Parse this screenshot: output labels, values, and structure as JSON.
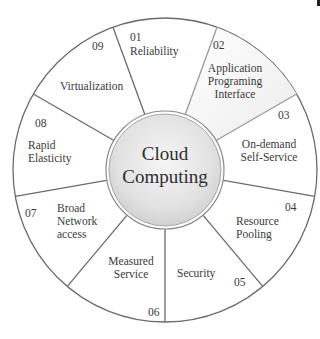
{
  "diagram": {
    "title": "Cloud Computing",
    "center": {
      "line1": "Cloud",
      "line2": "Computing"
    },
    "colors": {
      "outline": "#6b6b6b",
      "segment_fill": "#ffffff",
      "highlight_fill": "#f1f1f1",
      "center_fill_light": "#f7f7f7",
      "center_fill_dark": "#d6d6d6",
      "text": "#3a3a3a"
    },
    "segments": [
      {
        "number": "01",
        "lines": [
          "Reliability"
        ]
      },
      {
        "number": "02",
        "lines": [
          "Application",
          "Programing",
          "Interface"
        ],
        "highlighted": true
      },
      {
        "number": "03",
        "lines": [
          "On-demand",
          "Self-Service"
        ]
      },
      {
        "number": "04",
        "lines": [
          "Resource",
          "Pooling"
        ]
      },
      {
        "number": "05",
        "lines": [
          "Security"
        ]
      },
      {
        "number": "06",
        "lines": [
          "Measured",
          "Service"
        ]
      },
      {
        "number": "07",
        "lines": [
          "Broad",
          "Network",
          "access"
        ]
      },
      {
        "number": "08",
        "lines": [
          "Rapid",
          "Elasticity"
        ]
      },
      {
        "number": "09",
        "lines": [
          "Virtualization"
        ]
      }
    ]
  }
}
